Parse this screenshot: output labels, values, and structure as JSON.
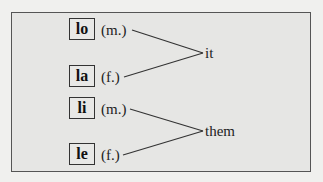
{
  "diagram": {
    "groups": [
      {
        "target": "it",
        "pronouns": [
          {
            "word": "lo",
            "gender": "(m.)"
          },
          {
            "word": "la",
            "gender": "(f.)"
          }
        ]
      },
      {
        "target": "them",
        "pronouns": [
          {
            "word": "li",
            "gender": "(m.)"
          },
          {
            "word": "le",
            "gender": "(f.)"
          }
        ]
      }
    ]
  }
}
